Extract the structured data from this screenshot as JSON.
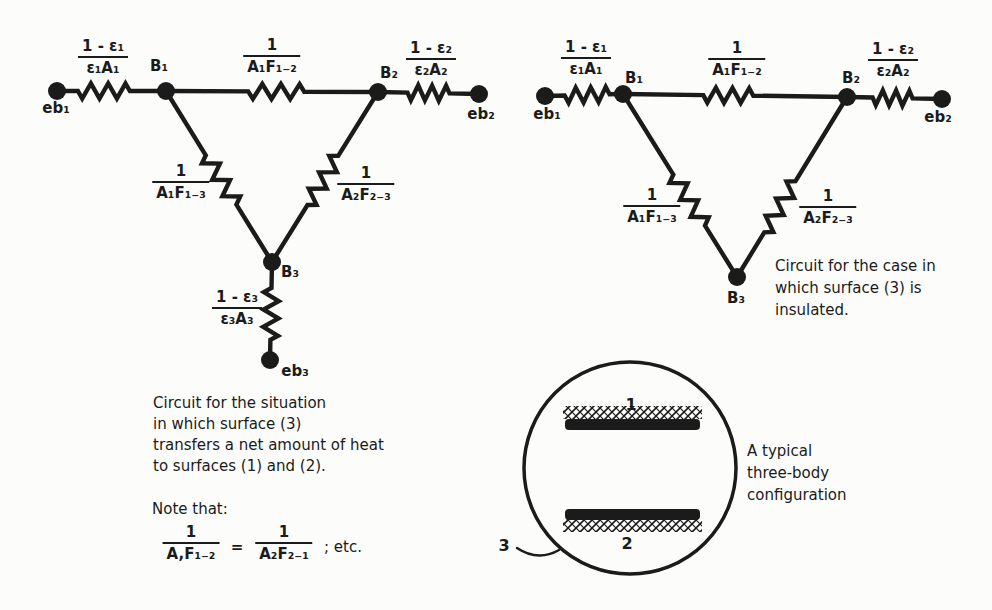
{
  "figure": {
    "ink": "#1b1b1b",
    "paper": "#fcfcfa"
  },
  "circuits": [
    {
      "name": "three-surface-network",
      "caption": {
        "x": 153,
        "top": 393,
        "lh": 21,
        "lines": [
          "Circuit for the situation",
          "in which surface (3)",
          "transfers a net amount of heat",
          "to surfaces (1) and (2)."
        ]
      },
      "nodes": [
        {
          "id": "eb1",
          "x": 57,
          "y": 91,
          "label": "eb₁",
          "lx": 56,
          "ly": 108
        },
        {
          "id": "B1",
          "x": 166,
          "y": 91,
          "label": "B₁",
          "lx": 159,
          "ly": 66
        },
        {
          "id": "B2",
          "x": 378,
          "y": 92,
          "label": "B₂",
          "lx": 389,
          "ly": 73
        },
        {
          "id": "eb2",
          "x": 479,
          "y": 94,
          "label": "eb₂",
          "lx": 481,
          "ly": 114
        },
        {
          "id": "B3",
          "x": 272,
          "y": 262,
          "label": "B₃",
          "lx": 290,
          "ly": 272
        },
        {
          "id": "eb3",
          "x": 270,
          "y": 360,
          "label": "eb₃",
          "lx": 295,
          "ly": 371
        }
      ],
      "edges": [
        {
          "from": "eb1",
          "to": "B1",
          "t": 0.43,
          "len": 52
        },
        {
          "from": "B1",
          "to": "B2",
          "t": 0.52,
          "len": 56
        },
        {
          "from": "B2",
          "to": "eb2",
          "t": 0.5,
          "len": 42
        },
        {
          "from": "B1",
          "to": "B3",
          "t": 0.52,
          "len": 58
        },
        {
          "from": "B2",
          "to": "B3",
          "t": 0.52,
          "len": 58
        },
        {
          "from": "B3",
          "to": "eb3",
          "t": 0.53,
          "len": 52
        }
      ],
      "fractions": [
        {
          "num": "1 - ε₁",
          "den": "ε₁A₁",
          "cx": 103,
          "top": 37
        },
        {
          "num": "1",
          "den": "A₁F₁₋₂",
          "cx": 272,
          "top": 36
        },
        {
          "num": "1 - ε₂",
          "den": "ε₂A₂",
          "cx": 431,
          "top": 39
        },
        {
          "num": "1",
          "den": "A₁F₁₋₃",
          "cx": 181,
          "top": 162
        },
        {
          "num": "1",
          "den": "A₂F₂₋₃",
          "cx": 366,
          "top": 164
        },
        {
          "num": "1 - ε₃",
          "den": "ε₃A₃",
          "cx": 237,
          "top": 288
        }
      ]
    },
    {
      "name": "insulated-surface-network",
      "caption": {
        "x": 775,
        "top": 256,
        "lh": 22,
        "lines": [
          "Circuit for the case in",
          "which surface (3) is",
          "insulated."
        ]
      },
      "nodes": [
        {
          "id": "eb1",
          "x": 545,
          "y": 96,
          "label": "eb₁",
          "lx": 547,
          "ly": 114
        },
        {
          "id": "B1",
          "x": 623,
          "y": 94,
          "label": "B₁",
          "lx": 634,
          "ly": 78
        },
        {
          "id": "B2",
          "x": 847,
          "y": 97,
          "label": "B₂",
          "lx": 851,
          "ly": 78
        },
        {
          "id": "eb2",
          "x": 942,
          "y": 99,
          "label": "eb₂",
          "lx": 938,
          "ly": 117
        },
        {
          "id": "B3",
          "x": 737,
          "y": 277,
          "label": "B₃",
          "lx": 736,
          "ly": 298
        }
      ],
      "edges": [
        {
          "from": "eb1",
          "to": "B1",
          "t": 0.54,
          "len": 45
        },
        {
          "from": "B1",
          "to": "B2",
          "t": 0.47,
          "len": 50
        },
        {
          "from": "B2",
          "to": "eb2",
          "t": 0.48,
          "len": 40
        },
        {
          "from": "B1",
          "to": "B3",
          "t": 0.58,
          "len": 60
        },
        {
          "from": "B2",
          "to": "B3",
          "t": 0.61,
          "len": 60
        }
      ],
      "fractions": [
        {
          "num": "1 - ε₁",
          "den": "ε₁A₁",
          "cx": 586,
          "top": 38
        },
        {
          "num": "1",
          "den": "A₁F₁₋₂",
          "cx": 737,
          "top": 39
        },
        {
          "num": "1 - ε₂",
          "den": "ε₂A₂",
          "cx": 893,
          "top": 40
        },
        {
          "num": "1",
          "den": "A₁F₁₋₃",
          "cx": 652,
          "top": 186
        },
        {
          "num": "1",
          "den": "A₂F₂₋₃",
          "cx": 828,
          "top": 187
        }
      ]
    }
  ],
  "note": {
    "heading": "Note that:",
    "x": 152,
    "top": 500,
    "lhs": {
      "num": "1",
      "den": "A,F₁₋₂",
      "cx": 191,
      "top": 523
    },
    "equals": {
      "text": "=",
      "cx": 237,
      "cy": 547
    },
    "rhs": {
      "num": "1",
      "den": "A₂F₂₋₁",
      "cx": 284,
      "top": 523
    },
    "suffix": {
      "text": "; etc.",
      "x": 324,
      "top": 538
    }
  },
  "inset": {
    "circle": {
      "cx": 630,
      "cy": 468,
      "r": 106
    },
    "slabs": [
      {
        "bar": [
          565,
          419,
          135,
          11
        ],
        "hatch": [
          563,
          406,
          139,
          13
        ]
      },
      {
        "bar": [
          565,
          509,
          135,
          11
        ],
        "hatch": [
          563,
          519,
          139,
          13
        ]
      }
    ],
    "labels": [
      {
        "text": "1",
        "cx": 631,
        "cy": 404
      },
      {
        "text": "2",
        "cx": 627,
        "cy": 543
      },
      {
        "text": "3",
        "cx": 504,
        "cy": 545
      }
    ],
    "leader": "M 517 548 Q 538 562 559 550",
    "caption": {
      "x": 747,
      "top": 441,
      "lh": 22,
      "lines": [
        "A typical",
        "three-body",
        "configuration"
      ]
    }
  }
}
